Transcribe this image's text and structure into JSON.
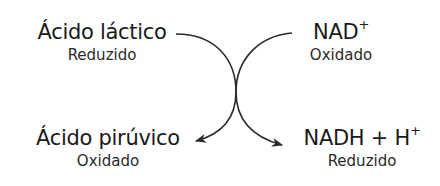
{
  "diagram": {
    "type": "coupled-redox-reaction",
    "nodes": {
      "lactic_acid": {
        "label": "Ácido láctico",
        "state": "Reduzido"
      },
      "nad": {
        "label_base": "NAD",
        "label_sup": "+",
        "state": "Oxidado"
      },
      "pyruvic_acid": {
        "label": "Ácido pirúvico",
        "state": "Oxidado"
      },
      "nadh": {
        "label_base": "NADH + H",
        "label_sup": "+",
        "state": "Reduzido"
      }
    },
    "edges": [
      {
        "from": "Ácido láctico",
        "to": "Ácido pirúvico"
      },
      {
        "from": "NAD+",
        "to": "NADH + H+"
      }
    ],
    "colors": {
      "text": "#1a1a1a",
      "arrow": "#2b2b2b",
      "background": "#ffffff"
    }
  }
}
